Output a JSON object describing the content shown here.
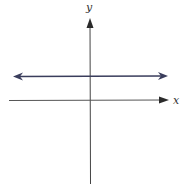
{
  "diagram": {
    "type": "coordinate-plane",
    "axes": {
      "x_label": "x",
      "y_label": "y",
      "color": "#444444"
    },
    "line": {
      "kind": "horizontal",
      "position": "above x-axis",
      "arrows": "both ends",
      "color": "#3a3d5c"
    }
  }
}
